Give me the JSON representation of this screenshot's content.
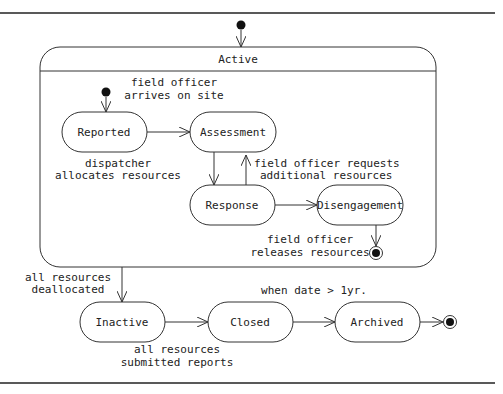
{
  "diagram": {
    "type": "UML state machine",
    "composite_state": {
      "label": "Active"
    },
    "states": {
      "reported": "Reported",
      "assessment": "Assessment",
      "response": "Response",
      "disengagement": "Disengagement",
      "inactive": "Inactive",
      "closed": "Closed",
      "archived": "Archived"
    },
    "transitions": {
      "init_to_reported": [
        "field officer",
        "arrives on site"
      ],
      "reported_to_assessment": [
        "dispatcher",
        "allocates resources"
      ],
      "response_to_assessment": [
        "field officer requests",
        "additional resources"
      ],
      "disengagement_to_final": [
        "field officer",
        "releases resources"
      ],
      "active_to_inactive": [
        "all resources",
        "deallocated"
      ],
      "inactive_to_closed": [
        "all resources",
        "submitted reports"
      ],
      "closed_to_archived": [
        "when date > 1yr."
      ]
    }
  }
}
